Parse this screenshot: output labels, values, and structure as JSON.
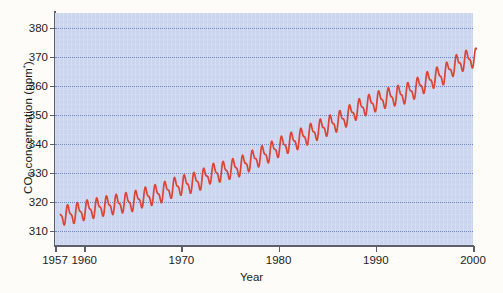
{
  "chart_data": {
    "type": "line",
    "title": "",
    "subtitle": "",
    "xlabel": "Year",
    "ylabel": "CO2 concentration (ppm*)",
    "ylabel_parts": {
      "prefix": "CO",
      "subscript": "2",
      "middle": " concentration (ppm",
      "superscript": "*",
      "suffix": ")"
    },
    "xlim": [
      1957,
      2000
    ],
    "ylim": [
      305,
      385
    ],
    "grid": "horizontal-dotted",
    "legend": "none",
    "series_color": "#dc4434",
    "plot_background": "#ccd5ef",
    "gridline_color": "#6f86c4",
    "axis_color": "#5a5f6b",
    "page_background": "#fdfcf8",
    "ytick_labels": [
      "310",
      "320",
      "330",
      "340",
      "350",
      "360",
      "370",
      "380"
    ],
    "ytick_values": [
      310,
      320,
      330,
      340,
      350,
      360,
      370,
      380
    ],
    "xtick_labels": [
      "1957",
      "1960",
      "1970",
      "1980",
      "1990",
      "2000"
    ],
    "xtick_values": [
      1957,
      1960,
      1970,
      1980,
      1990,
      2000
    ],
    "annotation": "Annual sawtooth oscillation of approximately 6 ppm peak-to-trough superimposed on a rising trend (Keeling curve).",
    "series": [
      {
        "name": "Atmospheric CO2 concentration",
        "x": [
          1958,
          1959,
          1960,
          1961,
          1962,
          1963,
          1964,
          1965,
          1966,
          1967,
          1968,
          1969,
          1970,
          1971,
          1972,
          1973,
          1974,
          1975,
          1976,
          1977,
          1978,
          1979,
          1980,
          1981,
          1982,
          1983,
          1984,
          1985,
          1986,
          1987,
          1988,
          1989,
          1990,
          1991,
          1992,
          1993,
          1994,
          1995,
          1996,
          1997,
          1998,
          1999,
          2000
        ],
        "values": [
          315.3,
          315.9,
          316.9,
          317.6,
          318.4,
          318.9,
          319.5,
          320.0,
          321.3,
          322.1,
          323.0,
          324.6,
          325.6,
          326.3,
          327.4,
          329.6,
          330.1,
          331.1,
          332.0,
          333.8,
          335.4,
          336.8,
          338.7,
          340.1,
          341.4,
          343.0,
          344.6,
          346.0,
          347.4,
          349.2,
          351.6,
          353.1,
          354.4,
          355.6,
          356.4,
          357.1,
          358.8,
          360.8,
          362.6,
          363.7,
          366.7,
          368.4,
          369.5
        ]
      }
    ]
  }
}
